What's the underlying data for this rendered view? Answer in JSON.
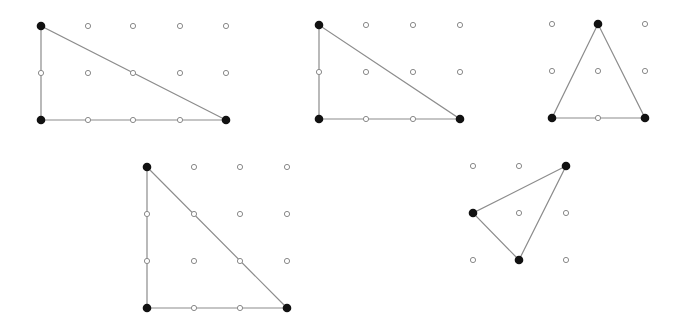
{
  "figures": [
    {
      "id": "figure-1",
      "grid": {
        "cols": [
          41,
          88,
          133,
          180,
          226
        ],
        "rows": [
          26,
          73,
          120
        ]
      },
      "triangle": [
        [
          41,
          26
        ],
        [
          41,
          120
        ],
        [
          226,
          120
        ]
      ]
    },
    {
      "id": "figure-2",
      "grid": {
        "cols": [
          319,
          366,
          413,
          460
        ],
        "rows": [
          25,
          72,
          119
        ]
      },
      "triangle": [
        [
          319,
          25
        ],
        [
          319,
          119
        ],
        [
          460,
          119
        ]
      ]
    },
    {
      "id": "figure-3",
      "grid": {
        "cols": [
          552,
          598,
          645
        ],
        "rows": [
          24,
          71,
          118
        ]
      },
      "triangle": [
        [
          598,
          24
        ],
        [
          552,
          118
        ],
        [
          645,
          118
        ]
      ]
    },
    {
      "id": "figure-4",
      "grid": {
        "cols": [
          147,
          194,
          240,
          287
        ],
        "rows": [
          167,
          214,
          261,
          308
        ]
      },
      "triangle": [
        [
          147,
          167
        ],
        [
          147,
          308
        ],
        [
          287,
          308
        ]
      ]
    },
    {
      "id": "figure-5",
      "grid": {
        "cols": [
          473,
          519,
          566
        ],
        "rows": [
          166,
          213,
          260
        ]
      },
      "triangle": [
        [
          566,
          166
        ],
        [
          473,
          213
        ],
        [
          519,
          260
        ]
      ]
    }
  ],
  "style": {
    "peg_radius": 2.6,
    "vertex_radius": 4.3,
    "edge_color": "#8c8c8c",
    "vertex_color": "#111111",
    "peg_stroke": "#8a8a8a"
  }
}
